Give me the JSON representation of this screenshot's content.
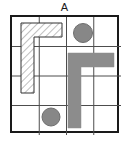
{
  "figure": {
    "panel_label": "A",
    "background_color": "#ffffff",
    "width": 129,
    "height": 142
  },
  "board": {
    "name": "puzzle-grid",
    "rows": 4,
    "columns": 4,
    "origin_x": 10,
    "origin_y": 15,
    "width": 109,
    "height": 118,
    "cell_width": 26.25,
    "cell_height": 28.5,
    "outer_border_color": "#1a1a1a",
    "outer_border_width": 2,
    "inner_line_color": "#4d4d4d",
    "inner_line_width": 1,
    "inner_vertical_x": [
      27.25,
      54.5,
      81.75
    ],
    "inner_horizontal_y": [
      29.5,
      59,
      88.5
    ]
  },
  "pieces": [
    {
      "name": "hatched-l-piece",
      "shape": "L",
      "fill_style": "diagonal-hatch",
      "fill_color": "#ffffff",
      "hatch_color": "#808080",
      "outline_color": "#333333",
      "outline_width": 1,
      "points": "11,8 52,8 52,22 24,22 24,78 11,78",
      "occupies_cells": "col1 rows1-3 plus col2 row1"
    },
    {
      "name": "gray-l-piece",
      "shape": "L",
      "fill_style": "solid",
      "fill_color": "#8c8c8c",
      "outline_color": "#8c8c8c",
      "outline_width": 0,
      "points": "58,38 104,38 104,52 71,52 71,113 58,113",
      "occupies_cells": "col3 rows2-4 plus col4 row2"
    }
  ],
  "tokens": [
    {
      "name": "gray-token-top",
      "shape": "circle",
      "fill_color": "#878787",
      "outline_color": "#6e6e6e",
      "center_x": 73,
      "center_y": 18,
      "radius": 9.5,
      "cell": "row1-col3"
    },
    {
      "name": "gray-token-bottom",
      "shape": "circle",
      "fill_color": "#878787",
      "outline_color": "#6e6e6e",
      "center_x": 41,
      "center_y": 102,
      "radius": 9,
      "cell": "row4-col2"
    }
  ]
}
